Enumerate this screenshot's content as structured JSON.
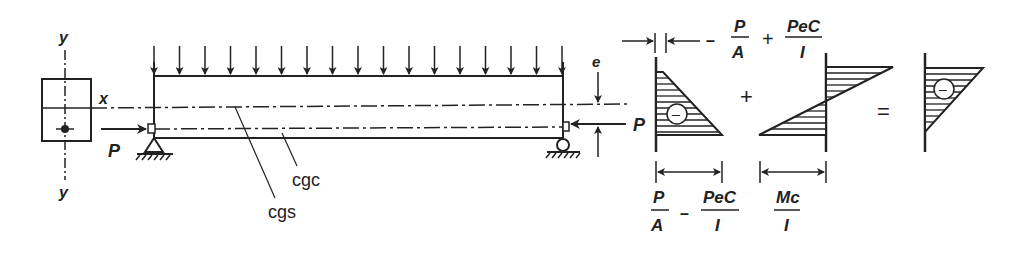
{
  "diagram": {
    "section": {
      "axis_y_top": "y",
      "axis_y_bottom": "y",
      "axis_x": "x"
    },
    "beam": {
      "prestress_left_label": "P",
      "prestress_right_label": "P",
      "eccentricity_label": "e",
      "cgc_label": "cgc",
      "cgs_label": "cgs",
      "load_arrow_count": 17
    },
    "stress_diagrams": {
      "top_dim": {
        "minus": "–",
        "t1_num": "P",
        "t1_den": "A",
        "plus": "+",
        "t2_num": "PeC",
        "t2_den": "I"
      },
      "plus_sign": "+",
      "equals_sign": "=",
      "neg_sign": "–",
      "bottom_dim1": {
        "t1_num": "P",
        "t1_den": "A",
        "minus": "–",
        "t2_num": "PeC",
        "t2_den": "I"
      },
      "bottom_dim2": {
        "num": "Mc",
        "den": "I"
      }
    },
    "colors": {
      "ink": "#222222",
      "background": "#ffffff"
    }
  }
}
